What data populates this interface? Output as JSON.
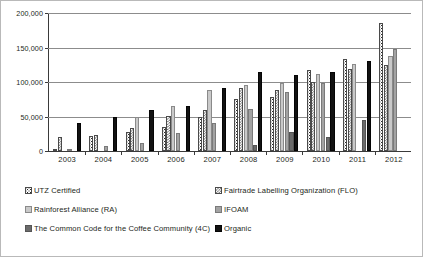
{
  "chart_data": {
    "type": "bar",
    "title": "",
    "subtitle": "",
    "xlabel": "",
    "ylabel": "",
    "grid": true,
    "legend_position": "bottom",
    "ylim": [
      0,
      200000
    ],
    "ytick_labels": [
      "200,000",
      "150,000",
      "100,000",
      "50,000",
      "0"
    ],
    "ytick_values": [
      200000,
      150000,
      100000,
      50000,
      0
    ],
    "categories": [
      "2003",
      "2004",
      "2005",
      "2006",
      "2007",
      "2008",
      "2009",
      "2010",
      "2011",
      "2012"
    ],
    "series": [
      {
        "name": "UTZ Certified",
        "pattern": "white-dotted",
        "color": "#ffffff",
        "values": [
          2500,
          22000,
          27500,
          35000,
          50000,
          75000,
          78000,
          118000,
          134000,
          185000
        ]
      },
      {
        "name": "Fairtrade Labelling Organization (FLO)",
        "pattern": "checkered-gray",
        "color": "#6e6e6e",
        "values": [
          20000,
          23000,
          33000,
          51000,
          60000,
          92000,
          89000,
          100000,
          119000,
          125000
        ]
      },
      {
        "name": "Rainforest Alliance (RA)",
        "pattern": "light-gray",
        "color": "#c9c9c9",
        "values": [
          0,
          0,
          50000,
          65000,
          88000,
          95000,
          99000,
          112000,
          126000,
          137000
        ]
      },
      {
        "name": "IFOAM",
        "pattern": "medium-gray",
        "color": "#a3a3a3",
        "values": [
          3000,
          7000,
          12000,
          26000,
          41000,
          61000,
          86000,
          98000,
          0,
          148000
        ]
      },
      {
        "name": "The Common Code for the Coffee Community (4C)",
        "pattern": "dark-gray",
        "color": "#6b6b6b",
        "values": [
          0,
          0,
          0,
          0,
          0,
          9000,
          27000,
          20000,
          45000,
          0
        ]
      },
      {
        "name": "Organic",
        "pattern": "black",
        "color": "#121212",
        "values": [
          41000,
          49000,
          60000,
          65000,
          92000,
          115000,
          110000,
          114000,
          130000,
          0
        ]
      }
    ]
  },
  "legend": {
    "items": [
      {
        "label": "UTZ Certified",
        "swatch": "utz-swatch"
      },
      {
        "label": "Fairtrade Labelling Organization (FLO)",
        "swatch": "flo-swatch"
      },
      {
        "label": "Rainforest Alliance (RA)",
        "swatch": "ra-swatch"
      },
      {
        "label": "IFOAM",
        "swatch": "ifoam-swatch"
      },
      {
        "label": "The Common Code for the Coffee Community (4C)",
        "swatch": "fourc-swatch"
      },
      {
        "label": "Organic",
        "swatch": "organic-swatch"
      }
    ]
  }
}
